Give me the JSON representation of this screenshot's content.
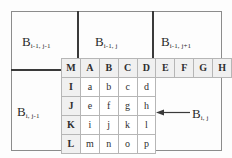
{
  "figure": {
    "type": "grid-neighbourhood-diagram",
    "colors": {
      "thick_line": "#3a3a3a",
      "thin_line": "#b6b6b6",
      "frame_line": "#8c8c8c",
      "header_fill": "#f0f0f0",
      "text": "#2b2b2b",
      "background": "#ffffff"
    }
  },
  "blocks": {
    "top_left": {
      "base": "B",
      "sub": "i-1, j-1"
    },
    "top_mid": {
      "base": "B",
      "sub": "i-1, j"
    },
    "top_right": {
      "base": "B",
      "sub": "i-1, j+1"
    },
    "bottom_left": {
      "base": "B",
      "sub": "i, j-1"
    },
    "current": {
      "base": "B",
      "sub": "i, j"
    }
  },
  "grid": {
    "column_headers": [
      "M",
      "A",
      "B",
      "C",
      "D",
      "E",
      "F",
      "G",
      "H"
    ],
    "row_headers": [
      "I",
      "J",
      "K",
      "L"
    ],
    "cells": [
      [
        "a",
        "b",
        "c",
        "d"
      ],
      [
        "e",
        "f",
        "g",
        "h"
      ],
      [
        "i",
        "j",
        "k",
        "l"
      ],
      [
        "m",
        "n",
        "o",
        "p"
      ]
    ]
  },
  "annotation": {
    "arrow": "arrow-left-icon",
    "points_to": "current block B(i,j)"
  }
}
